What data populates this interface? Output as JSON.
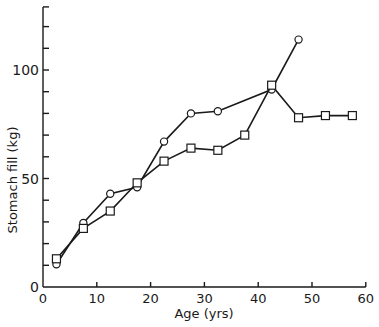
{
  "chart_data": {
    "type": "line",
    "title": "",
    "xlabel": "Age (yrs)",
    "ylabel": "Stomach fill (kg)",
    "xlim": [
      0,
      60
    ],
    "ylim": [
      0,
      130
    ],
    "x_ticks": [
      0,
      10,
      20,
      30,
      40,
      50,
      60
    ],
    "x_tick_labels": [
      "0",
      "10",
      "20",
      "30",
      "40",
      "50",
      "60"
    ],
    "y_ticks_minor_step": 10,
    "y_tick_labels": [
      "0",
      "50",
      "100"
    ],
    "y_tick_label_values": [
      0,
      50,
      100
    ],
    "grid": false,
    "legend": null,
    "series": [
      {
        "name": "circles",
        "marker": "circle",
        "x": [
          2.5,
          7.5,
          12.5,
          17.5,
          22.5,
          27.5,
          32.5,
          42.5,
          47.5
        ],
        "values": [
          10.5,
          29.5,
          43,
          46,
          67,
          80,
          81,
          91,
          114
        ]
      },
      {
        "name": "squares",
        "marker": "square",
        "x": [
          2.5,
          7.5,
          12.5,
          17.5,
          22.5,
          27.5,
          32.5,
          37.5,
          42.5,
          47.5,
          52.5,
          57.5
        ],
        "values": [
          13,
          27,
          35,
          48,
          58,
          64,
          63,
          70,
          93,
          78,
          79,
          79
        ]
      }
    ]
  },
  "labels": {
    "xlabel": "Age (yrs)",
    "ylabel": "Stomach fill (kg)"
  }
}
